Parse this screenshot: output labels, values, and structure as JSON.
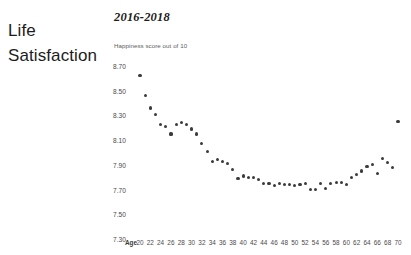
{
  "heading": {
    "line1": "Life",
    "line2": "Satisfaction"
  },
  "chart_header": {
    "title": "2016-2018",
    "axis_note": "Happiness score out of 10"
  },
  "colors": {
    "dot": "#3b3b3b",
    "text": "#1c1c1c",
    "tick": "#4a4a4a",
    "background": "#ffffff"
  },
  "chart_data": {
    "type": "scatter",
    "title": "2016-2018",
    "subtitle": "",
    "xlabel": "Age",
    "ylabel": "Happiness score out of 10",
    "xlim": [
      19,
      71
    ],
    "ylim": [
      7.3,
      8.7
    ],
    "grid": false,
    "legend": null,
    "ytick_labels": [
      "8.70",
      "8.50",
      "8.30",
      "8.10",
      "7.90",
      "7.70",
      "7.50",
      "7.30"
    ],
    "ytick_values": [
      8.7,
      8.5,
      8.3,
      8.1,
      7.9,
      7.7,
      7.5,
      7.3
    ],
    "xtick_labels": [
      "20",
      "22",
      "24",
      "26",
      "28",
      "30",
      "32",
      "34",
      "36",
      "38",
      "40",
      "42",
      "44",
      "46",
      "48",
      "50",
      "52",
      "54",
      "56",
      "58",
      "60",
      "62",
      "64",
      "66",
      "68",
      "70"
    ],
    "xtick_values": [
      20,
      22,
      24,
      26,
      28,
      30,
      32,
      34,
      36,
      38,
      40,
      42,
      44,
      46,
      48,
      50,
      52,
      54,
      56,
      58,
      60,
      62,
      64,
      66,
      68,
      70
    ],
    "x": [
      20,
      21,
      22,
      23,
      24,
      25,
      26,
      27,
      28,
      29,
      30,
      31,
      32,
      33,
      34,
      35,
      36,
      37,
      38,
      39,
      40,
      41,
      42,
      43,
      44,
      45,
      46,
      47,
      48,
      49,
      50,
      51,
      52,
      53,
      54,
      55,
      56,
      57,
      58,
      59,
      60,
      61,
      62,
      63,
      64,
      65,
      66,
      67,
      68,
      69,
      70
    ],
    "y": [
      8.62,
      8.46,
      8.36,
      8.31,
      8.23,
      8.21,
      8.15,
      8.23,
      8.24,
      8.23,
      8.19,
      8.15,
      8.07,
      8.01,
      7.93,
      7.94,
      7.93,
      7.91,
      7.86,
      7.79,
      7.81,
      7.8,
      7.8,
      7.78,
      7.75,
      7.75,
      7.73,
      7.75,
      7.74,
      7.74,
      7.73,
      7.74,
      7.75,
      7.7,
      7.7,
      7.75,
      7.71,
      7.75,
      7.76,
      7.76,
      7.74,
      7.8,
      7.82,
      7.85,
      7.89,
      7.9,
      7.83,
      7.95,
      7.92,
      7.88,
      8.25
    ]
  }
}
